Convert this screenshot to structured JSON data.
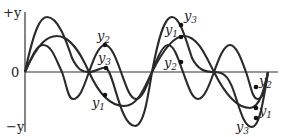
{
  "diagram": {
    "type": "wave-superposition",
    "axis": {
      "top_label": "+y",
      "zero_label": "0",
      "bottom_label": "−y"
    },
    "curves": [
      {
        "name": "y1",
        "label_base": "y",
        "label_sub": "1"
      },
      {
        "name": "y2",
        "label_base": "y",
        "label_sub": "2"
      },
      {
        "name": "y3",
        "label_base": "y",
        "label_sub": "3"
      }
    ],
    "markers": {
      "group_a": [
        {
          "curve": "y2",
          "label_base": "y",
          "label_sub": "2"
        },
        {
          "curve": "y3",
          "label_base": "y",
          "label_sub": "3"
        },
        {
          "curve": "y1",
          "label_base": "y",
          "label_sub": "1"
        }
      ],
      "group_b": [
        {
          "curve": "y3",
          "label_base": "y",
          "label_sub": "3"
        },
        {
          "curve": "y1",
          "label_base": "y",
          "label_sub": "1"
        },
        {
          "curve": "y2",
          "label_base": "y",
          "label_sub": "2"
        }
      ],
      "group_c": [
        {
          "curve": "y2",
          "label_base": "y",
          "label_sub": "2"
        },
        {
          "curve": "y1",
          "label_base": "y",
          "label_sub": "1"
        },
        {
          "curve": "y3",
          "label_base": "y",
          "label_sub": "3"
        }
      ]
    },
    "colors": {
      "line": "#2a2a2a",
      "axis": "#333333",
      "background": "#ffffff"
    }
  }
}
